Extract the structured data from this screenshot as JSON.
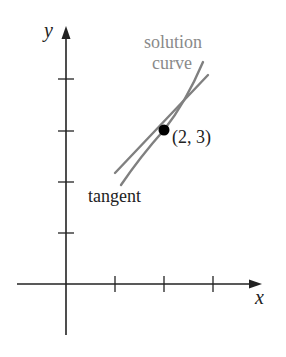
{
  "diagram": {
    "axes": {
      "x_label": "x",
      "y_label": "y"
    },
    "labels": {
      "solution_line1": "solution",
      "solution_line2": "curve",
      "point": "(2, 3)",
      "tangent": "tangent"
    },
    "colors": {
      "axis": "#222222",
      "curve": "#808080",
      "tangent": "#808080",
      "point": "#000000",
      "solution_label": "#8a8a8a"
    },
    "point": {
      "x": 2,
      "y": 3
    },
    "x_ticks": [
      1,
      2,
      3
    ],
    "y_ticks": [
      1,
      2,
      3,
      4
    ]
  }
}
